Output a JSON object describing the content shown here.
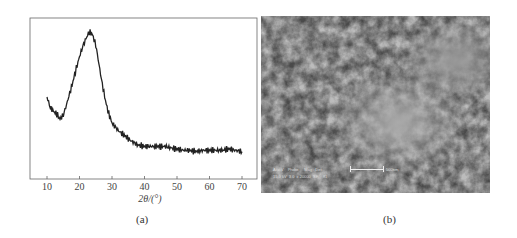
{
  "chart_data": {
    "type": "line",
    "title": "",
    "xlabel": "2θ/(°)",
    "ylabel": "",
    "xlim": [
      5,
      75
    ],
    "xticks": [
      10,
      20,
      30,
      40,
      50,
      60,
      70
    ],
    "yticks": [],
    "grid": false,
    "legend": null,
    "series": [
      {
        "name": "XRD pattern",
        "x": [
          10,
          11,
          12,
          13,
          14,
          15,
          16,
          17,
          18,
          19,
          20,
          21,
          22,
          23,
          24,
          25,
          26,
          27,
          28,
          29,
          30,
          32,
          34,
          36,
          38,
          40,
          42,
          44,
          46,
          48,
          50,
          52,
          54,
          56,
          58,
          60,
          62,
          64,
          66,
          68,
          70
        ],
        "values": [
          0.5,
          0.42,
          0.39,
          0.37,
          0.33,
          0.36,
          0.44,
          0.53,
          0.62,
          0.72,
          0.81,
          0.89,
          0.95,
          1.0,
          0.98,
          0.9,
          0.75,
          0.6,
          0.47,
          0.37,
          0.3,
          0.24,
          0.2,
          0.16,
          0.13,
          0.12,
          0.12,
          0.12,
          0.12,
          0.11,
          0.1,
          0.09,
          0.09,
          0.08,
          0.09,
          0.09,
          0.09,
          0.09,
          0.1,
          0.09,
          0.08
        ]
      }
    ],
    "panel_label": "(a)"
  },
  "figure_b": {
    "panel_label": "(b)",
    "type": "SEM micrograph",
    "info_header": [
      "Acc.V",
      "Probe",
      "Mag",
      "Det"
    ],
    "info_values": [
      "15.0 kV",
      "3.0",
      "x 20000",
      "SE",
      "81"
    ],
    "scale_bar": "500nm"
  }
}
